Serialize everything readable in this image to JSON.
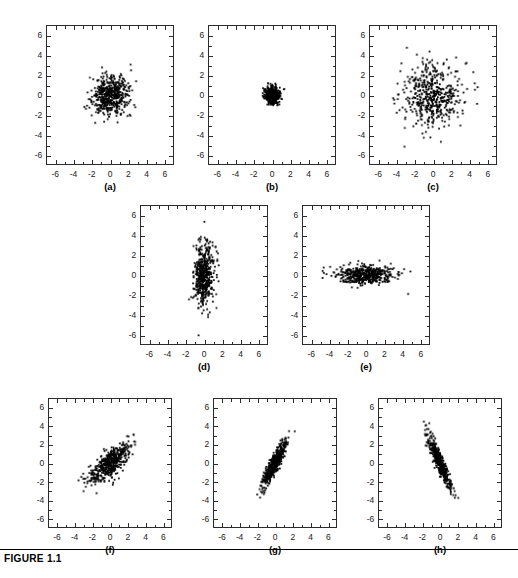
{
  "figure": {
    "caption": "FIGURE 1.1",
    "axis": {
      "xticks": [
        "-6",
        "-4",
        "-2",
        "0",
        "2",
        "4",
        "6"
      ],
      "yticks": [
        "6",
        "4",
        "2",
        "0",
        "-2",
        "-4",
        "-6"
      ],
      "xlim": [
        -7,
        7
      ],
      "ylim": [
        -7,
        7
      ],
      "tick_values": [
        -6,
        -4,
        -2,
        0,
        2,
        4,
        6
      ],
      "minor_ticks": true,
      "ticks_all_sides": true,
      "tick_direction": "in",
      "grid": false
    },
    "marker": {
      "color": "#000000",
      "size_px": 1.8,
      "shape": "square"
    }
  },
  "chart_data": [
    {
      "type": "scatter",
      "label": "(a)",
      "title": "",
      "xlabel": "",
      "ylabel": "",
      "xlim": [
        -7,
        7
      ],
      "ylim": [
        -7,
        7
      ],
      "n_points": 500,
      "sigma_x": 1.0,
      "sigma_y": 1.0,
      "rho": 0.0,
      "mean_x": 0.0,
      "mean_y": 0.0,
      "seed": 11
    },
    {
      "type": "scatter",
      "label": "(b)",
      "title": "",
      "xlabel": "",
      "ylabel": "",
      "xlim": [
        -7,
        7
      ],
      "ylim": [
        -7,
        7
      ],
      "n_points": 500,
      "sigma_x": 0.4,
      "sigma_y": 0.4,
      "rho": 0.0,
      "mean_x": 0.0,
      "mean_y": 0.0,
      "seed": 23
    },
    {
      "type": "scatter",
      "label": "(c)",
      "title": "",
      "xlabel": "",
      "ylabel": "",
      "xlim": [
        -7,
        7
      ],
      "ylim": [
        -7,
        7
      ],
      "n_points": 500,
      "sigma_x": 1.6,
      "sigma_y": 1.6,
      "rho": 0.0,
      "mean_x": 0.0,
      "mean_y": 0.0,
      "seed": 37
    },
    {
      "type": "scatter",
      "label": "(d)",
      "title": "",
      "xlabel": "",
      "ylabel": "",
      "xlim": [
        -7,
        7
      ],
      "ylim": [
        -7,
        7
      ],
      "n_points": 500,
      "sigma_x": 0.55,
      "sigma_y": 1.6,
      "rho": 0.0,
      "mean_x": 0.0,
      "mean_y": 0.0,
      "seed": 59
    },
    {
      "type": "scatter",
      "label": "(e)",
      "title": "",
      "xlabel": "",
      "ylabel": "",
      "xlim": [
        -7,
        7
      ],
      "ylim": [
        -7,
        7
      ],
      "n_points": 500,
      "sigma_x": 1.6,
      "sigma_y": 0.45,
      "rho": 0.0,
      "mean_x": 0.0,
      "mean_y": 0.0,
      "seed": 71
    },
    {
      "type": "scatter",
      "label": "(f)",
      "title": "",
      "xlabel": "",
      "ylabel": "",
      "xlim": [
        -7,
        7
      ],
      "ylim": [
        -7,
        7
      ],
      "n_points": 500,
      "sigma_x": 1.15,
      "sigma_y": 1.05,
      "rho": 0.75,
      "mean_x": 0.0,
      "mean_y": 0.0,
      "seed": 89
    },
    {
      "type": "scatter",
      "label": "(g)",
      "title": "",
      "xlabel": "",
      "ylabel": "",
      "xlim": [
        -7,
        7
      ],
      "ylim": [
        -7,
        7
      ],
      "n_points": 500,
      "sigma_x": 0.7,
      "sigma_y": 1.3,
      "rho": 0.9,
      "mean_x": 0.0,
      "mean_y": 0.0,
      "seed": 101
    },
    {
      "type": "scatter",
      "label": "(h)",
      "title": "",
      "xlabel": "",
      "ylabel": "",
      "xlim": [
        -7,
        7
      ],
      "ylim": [
        -7,
        7
      ],
      "n_points": 500,
      "sigma_x": 0.7,
      "sigma_y": 1.45,
      "rho": -0.92,
      "mean_x": 0.0,
      "mean_y": 0.0,
      "seed": 127
    }
  ],
  "layout": {
    "panels": [
      {
        "key": "a",
        "left": 46,
        "top": 25,
        "width": 128,
        "height": 140,
        "label_y": 181
      },
      {
        "key": "b",
        "left": 208,
        "top": 25,
        "width": 128,
        "height": 140,
        "label_y": 181
      },
      {
        "key": "c",
        "left": 369,
        "top": 25,
        "width": 128,
        "height": 140,
        "label_y": 181
      },
      {
        "key": "d",
        "left": 140,
        "top": 205,
        "width": 128,
        "height": 140,
        "label_y": 361
      },
      {
        "key": "e",
        "left": 302,
        "top": 205,
        "width": 128,
        "height": 140,
        "label_y": 361
      },
      {
        "key": "f",
        "left": 48,
        "top": 398,
        "width": 124,
        "height": 130,
        "label_y": 544
      },
      {
        "key": "g",
        "left": 213,
        "top": 398,
        "width": 124,
        "height": 130,
        "label_y": 544
      },
      {
        "key": "h",
        "left": 378,
        "top": 398,
        "width": 124,
        "height": 130,
        "label_y": 544
      }
    ]
  }
}
